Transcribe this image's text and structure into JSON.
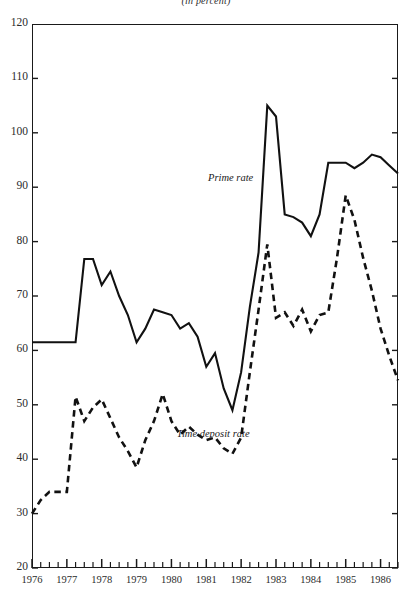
{
  "chart_data": {
    "type": "line",
    "title": "(in percent)",
    "xlabel": "",
    "ylabel": "",
    "ylim": [
      20,
      120
    ],
    "xlim": [
      1976.0,
      1986.5
    ],
    "yticks": [
      20,
      30,
      40,
      50,
      60,
      70,
      80,
      90,
      100,
      110,
      120
    ],
    "xticks": [
      1976,
      1977,
      1978,
      1979,
      1980,
      1981,
      1982,
      1983,
      1984,
      1985,
      1986
    ],
    "minor_ticks_per_year": 4,
    "grid": false,
    "legend": "inline-annotations",
    "series": [
      {
        "name": "Prime rate",
        "style": "solid",
        "color": "#111111",
        "label_x": 1981.05,
        "label_y": 91.5,
        "x": [
          1976.0,
          1976.25,
          1976.5,
          1976.75,
          1977.0,
          1977.25,
          1977.5,
          1977.75,
          1978.0,
          1978.25,
          1978.5,
          1978.75,
          1979.0,
          1979.25,
          1979.5,
          1979.75,
          1980.0,
          1980.25,
          1980.5,
          1980.75,
          1981.0,
          1981.25,
          1981.5,
          1981.75,
          1982.0,
          1982.25,
          1982.5,
          1982.75,
          1983.0,
          1983.25,
          1983.5,
          1983.75,
          1984.0,
          1984.25,
          1984.5,
          1984.75,
          1985.0,
          1985.25,
          1985.5,
          1985.75,
          1986.0,
          1986.25,
          1986.5
        ],
        "y": [
          61.5,
          61.5,
          61.5,
          61.5,
          61.5,
          61.5,
          76.8,
          76.8,
          72.0,
          74.5,
          70.0,
          66.5,
          61.5,
          64.0,
          67.5,
          67.0,
          66.5,
          64.0,
          65.0,
          62.5,
          57.0,
          59.5,
          53.0,
          49.0,
          56.0,
          68.0,
          78.0,
          105.0,
          103.0,
          85.0,
          84.5,
          83.5,
          81.0,
          85.0,
          94.5,
          94.5,
          94.5,
          93.5,
          94.5,
          96.0,
          95.5,
          94.0,
          92.5
        ]
      },
      {
        "name": "Time deposit rate",
        "style": "dashed",
        "color": "#111111",
        "label_x": 1980.15,
        "label_y": 44.5,
        "x": [
          1976.0,
          1976.25,
          1976.5,
          1976.75,
          1977.0,
          1977.25,
          1977.5,
          1977.75,
          1978.0,
          1978.25,
          1978.5,
          1978.75,
          1979.0,
          1979.25,
          1979.5,
          1979.75,
          1980.0,
          1980.25,
          1980.5,
          1980.75,
          1981.0,
          1981.25,
          1981.5,
          1981.75,
          1982.0,
          1982.25,
          1982.5,
          1982.75,
          1983.0,
          1983.25,
          1983.5,
          1983.75,
          1984.0,
          1984.25,
          1984.5,
          1984.75,
          1985.0,
          1985.25,
          1985.5,
          1985.75,
          1986.0,
          1986.25,
          1986.5
        ],
        "y": [
          30.0,
          32.5,
          34.0,
          34.0,
          34.0,
          51.5,
          47.0,
          49.5,
          51.0,
          47.5,
          44.0,
          41.5,
          38.5,
          43.5,
          47.0,
          52.0,
          47.0,
          44.5,
          46.0,
          44.5,
          43.5,
          44.0,
          42.0,
          41.0,
          44.0,
          56.0,
          67.5,
          79.5,
          66.0,
          67.0,
          64.5,
          67.5,
          63.5,
          66.5,
          67.0,
          77.0,
          88.5,
          84.0,
          77.0,
          71.0,
          64.0,
          59.0,
          54.5
        ]
      }
    ]
  }
}
